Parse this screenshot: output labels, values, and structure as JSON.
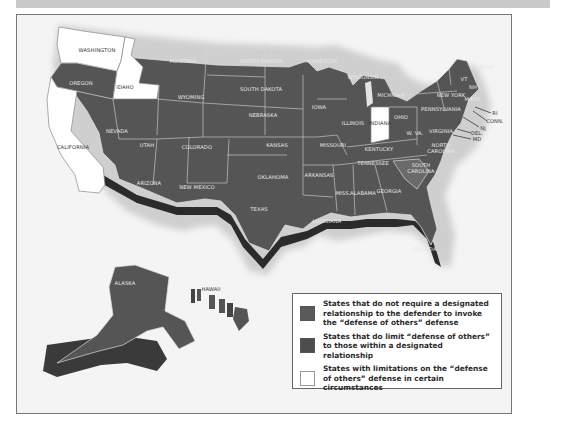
{
  "figure": {
    "type": "US state map (monochrome)",
    "colors": {
      "no_relationship_required": "#5a5a5a",
      "relationship_limited": "#4d4d4d",
      "limitations_in_circumstances": "#ffffff",
      "background": "#f4f4f4",
      "frame_border": "#777777",
      "top_bar": "#c9c9c9"
    }
  },
  "states": {
    "washington": "WASHINGTON",
    "oregon": "OREGON",
    "california": "CALIFORNIA",
    "idaho": "IDAHO",
    "nevada": "NEVADA",
    "montana": "MONTANA",
    "wyoming": "WYOMING",
    "utah": "UTAH",
    "colorado": "COLORADO",
    "arizona": "ARIZONA",
    "new_mexico": "NEW MEXICO",
    "north_dakota": "NORTH DAKOTA",
    "south_dakota": "SOUTH DAKOTA",
    "nebraska": "NEBRASKA",
    "kansas": "KANSAS",
    "oklahoma": "OKLAHOMA",
    "texas": "TEXAS",
    "minnesota": "MINNESOTA",
    "iowa": "IOWA",
    "missouri": "MISSOURI",
    "arkansas": "ARKANSAS",
    "louisiana": "LOUISIANA",
    "wisconsin": "WISCONSIN",
    "illinois": "ILLINOIS",
    "michigan": "MICHIGAN",
    "indiana": "INDIANA",
    "ohio": "OHIO",
    "kentucky": "KENTUCKY",
    "tennessee": "TENNESSEE",
    "mississippi": "MISS.",
    "alabama": "ALABAMA",
    "georgia": "GEORGIA",
    "florida": "FLORIDA",
    "south_carolina_1": "SOUTH",
    "south_carolina_2": "CAROLINA",
    "north_carolina_1": "NORTH",
    "north_carolina_2": "CAROLINA",
    "virginia": "VIRGINIA",
    "west_virginia": "W. VA.",
    "pennsylvania": "PENNSYLVANIA",
    "new_york": "NEW YORK",
    "vermont": "VT",
    "new_hampshire": "NH",
    "maine": "MAINE",
    "massachusetts": "MASS.",
    "rhode_island": "RI",
    "connecticut": "CONN.",
    "new_jersey": "NJ",
    "delaware": "DEL.",
    "maryland": "MD",
    "alaska": "ALASKA",
    "hawaii": "HAWAII"
  },
  "legend": {
    "items": [
      {
        "label": "States that do not require a designated relationship to the defender to invoke the “defense of others” defense",
        "color": "#5a5a5a"
      },
      {
        "label": "States that do limit “defense of others” to those within a designated relationship",
        "color": "#4d4d4d"
      },
      {
        "label": "States with limitations on the “defense of others” defense in certain circumstances",
        "color": "#ffffff"
      }
    ]
  },
  "categories": {
    "limitations_in_circumstances": [
      "WASHINGTON",
      "IDAHO",
      "CALIFORNIA",
      "INDIANA"
    ],
    "relationship_limited": [
      "SOUTH CAROLINA"
    ]
  }
}
